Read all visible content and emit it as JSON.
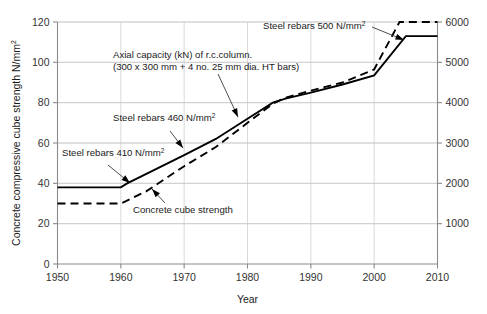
{
  "chart_data": {
    "type": "line",
    "title": "",
    "xlabel": "Year",
    "ylabel": "Concrete compressive cube strength N/mm2",
    "ylabel_main": "Concrete compressive cube strength N/mm",
    "ylabel_sup": "2",
    "xlim": [
      1950,
      2010
    ],
    "ylim": [
      0,
      120
    ],
    "y2lim": [
      0,
      6000
    ],
    "grid": true,
    "legend_position": "none (inline annotations)",
    "x_ticks": [
      "1950",
      "1960",
      "1970",
      "1980",
      "1990",
      "2000",
      "2010"
    ],
    "x_tick_values": [
      1950,
      1960,
      1970,
      1980,
      1990,
      2000,
      2010
    ],
    "y_ticks": [
      "0",
      "20",
      "40",
      "60",
      "80",
      "100",
      "120"
    ],
    "y_tick_values": [
      0,
      20,
      40,
      60,
      80,
      100,
      120
    ],
    "y2_ticks": [
      "1000",
      "2000",
      "3000",
      "4000",
      "5000",
      "6000"
    ],
    "y2_tick_values": [
      1000,
      2000,
      3000,
      4000,
      5000,
      6000
    ],
    "series": [
      {
        "name": "Axial capacity (kN) of r.c.column.",
        "style": "solid",
        "axis": "left",
        "x": [
          1950,
          1960,
          1961,
          1970,
          1975,
          1980,
          1984,
          1986,
          1990,
          1995,
          2000,
          2005,
          2010
        ],
        "values": [
          38,
          38,
          40,
          54,
          62,
          72,
          80,
          82,
          85,
          89,
          93.5,
          113,
          113
        ]
      },
      {
        "name": "Concrete cube strength",
        "style": "dashed",
        "axis": "left",
        "x": [
          1950,
          1960,
          1964,
          1970,
          1975,
          1980,
          1984,
          1986,
          1990,
          1995,
          2000,
          2004,
          2010
        ],
        "values": [
          30,
          30,
          36,
          48.5,
          58,
          70,
          79.5,
          82.5,
          86,
          90,
          96.5,
          120,
          120
        ]
      }
    ],
    "annotations": [
      {
        "id": "steel-500",
        "text_lines": [
          "Steel rebars 500 N/mm"
        ],
        "superscript": "2",
        "text_x": 263,
        "text_y": 29,
        "anchor": "start",
        "leader_from": [
          372,
          27
        ],
        "leader_to": [
          404,
          40
        ]
      },
      {
        "id": "axial-capacity",
        "text_lines": [
          "Axial capacity (kN) of r.c.column.",
          "(300 x 300 mm + 4 no. 25 mm dia. HT bars)"
        ],
        "text_x": 113,
        "text_y": 58,
        "anchor": "start",
        "leader_from": [
          218,
          74
        ],
        "leader_to": [
          238,
          117
        ]
      },
      {
        "id": "steel-460",
        "text_lines": [
          "Steel rebars 460 N/mm"
        ],
        "superscript": "2",
        "text_x": 113,
        "text_y": 121,
        "anchor": "start",
        "leader_from": [
          170,
          131
        ],
        "leader_to": [
          183,
          148
        ]
      },
      {
        "id": "steel-410",
        "text_lines": [
          "Steel rebars 410 N/mm"
        ],
        "superscript": "2",
        "text_x": 62,
        "text_y": 156,
        "anchor": "start",
        "leader_from": [
          108,
          165
        ],
        "leader_to": [
          130,
          183
        ]
      },
      {
        "id": "concrete-cube-strength",
        "text_lines": [
          "Concrete cube strength"
        ],
        "text_x": 133,
        "text_y": 213,
        "anchor": "start",
        "leader_from": [
          165,
          203
        ],
        "leader_to": [
          152,
          189
        ]
      }
    ]
  },
  "colors": {
    "background": "#ffffff",
    "grid": "#c9c9c9",
    "axis": "#8a8a8a",
    "series": "#000000",
    "text": "#1a1a1a"
  }
}
